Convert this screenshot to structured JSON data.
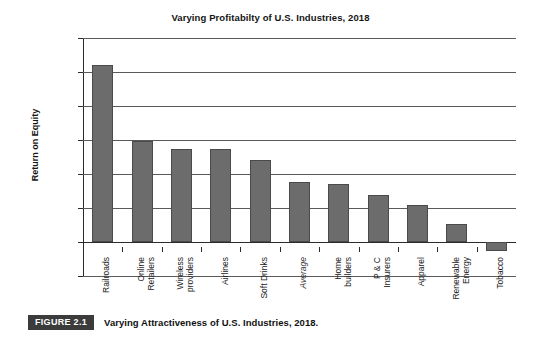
{
  "figure": {
    "badge": "FIGURE 2.1",
    "caption": "Varying Attractiveness of U.S. Industries, 2018."
  },
  "colors": {
    "bar": "#6c6c6c",
    "bar_border": "#4a4a4a",
    "gridline": "#5a5a5a",
    "axis": "#2b2b2b",
    "badge_background": "#3b3b3b",
    "badge_text": "#ffffff",
    "background": "#ffffff",
    "text": "#1a1a1a"
  },
  "chart_data": {
    "type": "bar",
    "title": "Varying Profitabilty of U.S. Industries, 2018",
    "xlabel": "",
    "ylabel": "Return on Equity",
    "ylim": [
      -10,
      60
    ],
    "ytick_labels": [
      "60%",
      "50%",
      "40%",
      "30%",
      "20%",
      "10%",
      "0%",
      "-10%"
    ],
    "ytick_values": [
      60,
      50,
      40,
      30,
      20,
      10,
      0,
      -10
    ],
    "grid": true,
    "legend": null,
    "value_unit": "percent",
    "categories": [
      "Railroads",
      "Online Retailers",
      "Wireless providers",
      "Airlines",
      "Soft Drinks",
      "Average",
      "Home builders",
      "P & C Insurers",
      "Apparel",
      "Renewable Energy",
      "Tobacco"
    ],
    "category_lines": [
      [
        "Railroads"
      ],
      [
        "Online",
        "Retailers"
      ],
      [
        "Wireless",
        "providers"
      ],
      [
        "Airlines"
      ],
      [
        "Soft Drinks"
      ],
      [
        "Average"
      ],
      [
        "Home",
        "builders"
      ],
      [
        "P & C",
        "Insurers"
      ],
      [
        "Apparel"
      ],
      [
        "Renewable",
        "Energy"
      ],
      [
        "Tobacco"
      ]
    ],
    "emphasis": {
      "italic_categories": [
        "Average"
      ]
    },
    "values": [
      52.0,
      29.7,
      27.5,
      27.4,
      24.2,
      17.6,
      17.0,
      13.8,
      11.0,
      5.4,
      -2.6
    ]
  }
}
